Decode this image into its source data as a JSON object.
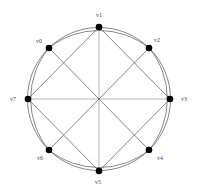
{
  "diagram": {
    "type": "graph",
    "layout": "circular",
    "center": [
      99,
      99
    ],
    "radius": 71,
    "nodes": [
      {
        "id": "v0",
        "label": "v0",
        "x": 49,
        "y": 48,
        "label_x": 36,
        "label_y": 42
      },
      {
        "id": "v1",
        "label": "v1",
        "x": 99,
        "y": 27,
        "label_x": 96,
        "label_y": 17
      },
      {
        "id": "v2",
        "label": "v2",
        "x": 149,
        "y": 48,
        "label_x": 155,
        "label_y": 42
      },
      {
        "id": "v3",
        "label": "v3",
        "x": 170,
        "y": 99,
        "label_x": 181,
        "label_y": 101
      },
      {
        "id": "v4",
        "label": "v4",
        "x": 149,
        "y": 150,
        "label_x": 157,
        "label_y": 160
      },
      {
        "id": "v5",
        "label": "v5",
        "x": 99,
        "y": 171,
        "label_x": 95,
        "label_y": 183
      },
      {
        "id": "v6",
        "label": "v6",
        "x": 49,
        "y": 150,
        "label_x": 36,
        "label_y": 160
      },
      {
        "id": "v7",
        "label": "v7",
        "x": 28,
        "y": 99,
        "label_x": 10,
        "label_y": 101
      }
    ],
    "edges": [
      {
        "from": "v1",
        "to": "v5",
        "style": "axis"
      },
      {
        "from": "v7",
        "to": "v3",
        "style": "axis"
      },
      {
        "from": "v0",
        "to": "v4",
        "style": "line"
      },
      {
        "from": "v2",
        "to": "v6",
        "style": "line"
      },
      {
        "from": "v1",
        "to": "v3",
        "style": "line"
      },
      {
        "from": "v3",
        "to": "v5",
        "style": "line"
      },
      {
        "from": "v5",
        "to": "v7",
        "style": "line"
      },
      {
        "from": "v7",
        "to": "v1",
        "style": "line"
      },
      {
        "from": "v0",
        "to": "v2",
        "style": "arc"
      },
      {
        "from": "v2",
        "to": "v4",
        "style": "arc"
      },
      {
        "from": "v4",
        "to": "v6",
        "style": "arc"
      },
      {
        "from": "v6",
        "to": "v0",
        "style": "arc"
      }
    ],
    "outer_circle": true
  }
}
